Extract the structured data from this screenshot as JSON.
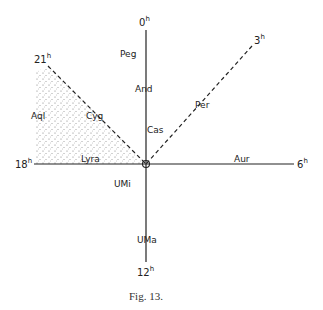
{
  "figure": {
    "caption": "Fig. 13.",
    "hour_labels": {
      "h0": {
        "num": "0",
        "sup": "h"
      },
      "h3": {
        "num": "3",
        "sup": "h"
      },
      "h6": {
        "num": "6",
        "sup": "h"
      },
      "h12": {
        "num": "12",
        "sup": "h"
      },
      "h18": {
        "num": "18",
        "sup": "h"
      },
      "h21": {
        "num": "21",
        "sup": "h"
      }
    },
    "constellations": {
      "peg": "Peg",
      "and": "And",
      "cas": "Cas",
      "per": "Per",
      "aur": "Aur",
      "aql": "Aql",
      "cyg": "Cyg",
      "lyra": "Lyra",
      "umi": "UMi",
      "uma": "UMa"
    },
    "colors": {
      "line": "#222222",
      "stipple": "#777777"
    }
  }
}
